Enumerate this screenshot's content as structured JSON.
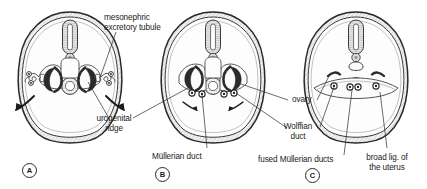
{
  "figure": {
    "ink_color": "#1a1a1a",
    "fill_light": "#fbfbfb",
    "fill_shade": "#e8e8e8",
    "background": "#ffffff"
  },
  "labels": {
    "mesonephric_excretory_tubule": "mesonephric\nexcretory tubule",
    "urogenital_ridge": "urogenital\nridge",
    "mullerian_duct": "Müllerian duct",
    "ovary": "ovary",
    "wolffian_duct": "Wolffian\nduct",
    "fused_mullerian_ducts": "fused Müllerian ducts",
    "broad_ligament": "broad lig. of\nthe uterus"
  },
  "panels": [
    {
      "letter": "A",
      "stage": "indifferent stage with urogenital ridges"
    },
    {
      "letter": "B",
      "stage": "ducts migrating medially"
    },
    {
      "letter": "C",
      "stage": "fused Müllerian ducts and broad ligament"
    }
  ]
}
